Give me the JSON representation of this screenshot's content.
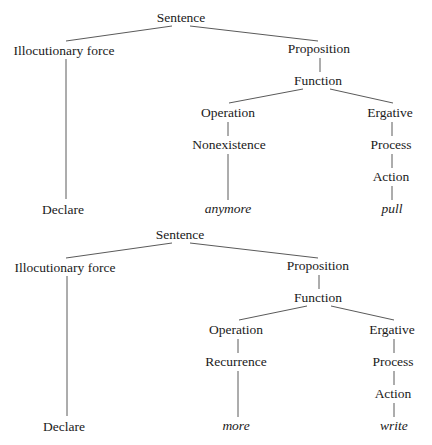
{
  "trees": [
    {
      "nodes": {
        "sentence": "Sentence",
        "illocutionary_force": "Illocutionary force",
        "proposition": "Proposition",
        "function": "Function",
        "operation": "Operation",
        "operation_child": "Nonexistence",
        "ergative": "Ergative",
        "process": "Process",
        "action": "Action",
        "declare": "Declare",
        "operation_leaf": "anymore",
        "action_leaf": "pull"
      }
    },
    {
      "nodes": {
        "sentence": "Sentence",
        "illocutionary_force": "Illocutionary force",
        "proposition": "Proposition",
        "function": "Function",
        "operation": "Operation",
        "operation_child": "Recurrence",
        "ergative": "Ergative",
        "process": "Process",
        "action": "Action",
        "declare": "Declare",
        "operation_leaf": "more",
        "action_leaf": "write"
      }
    }
  ],
  "style": {
    "text_color": "#1a1a1a",
    "edge_color": "#5a5a5a",
    "background": "#ffffff"
  }
}
